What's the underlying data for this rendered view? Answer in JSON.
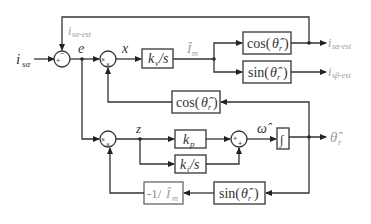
{
  "diagram": {
    "type": "block-diagram",
    "title": "",
    "inputs": {
      "i_s_alpha": {
        "base": "i",
        "sub": "sα"
      }
    },
    "feedback_label": {
      "base": "i",
      "sub": "sα-est"
    },
    "signals": {
      "e": "e",
      "x": "x",
      "z": "z",
      "Im_hat": {
        "base": "Î",
        "sub": "m"
      },
      "omega_hat": "ω̂"
    },
    "blocks": {
      "kv_s": {
        "k": "k",
        "sub": "v",
        "rest": "/s"
      },
      "cos_top": {
        "fn": "cos(",
        "theta": "θ̂",
        "sub": "r",
        "close": ")"
      },
      "sin_top": {
        "fn": "sin(",
        "theta": "θ̂",
        "sub": "r",
        "close": ")"
      },
      "cos_mid": {
        "fn": "cos(",
        "theta": "θ̂",
        "sub": "r",
        "close": ")"
      },
      "kp": {
        "k": "k",
        "sub": "p"
      },
      "ki_s": {
        "k": "k",
        "sub": "i",
        "rest": "/s"
      },
      "integrator": {
        "symbol": "∫"
      },
      "neg_inv_Im": {
        "prefix": "-1/ ",
        "base": "Î",
        "sub": "m"
      },
      "sin_bottom": {
        "fn": "sin(",
        "theta": "θ̂",
        "sub": "r",
        "close": ")"
      }
    },
    "junctions": {
      "sum1": {
        "signs": [
          "+",
          "−"
        ]
      },
      "mult1": {
        "signs": [
          "×",
          "×"
        ]
      },
      "mult2": {
        "signs": [
          "×",
          "×"
        ]
      },
      "sum2": {
        "signs": [
          "+",
          "+"
        ]
      }
    },
    "outputs": {
      "i_s_alpha_est": {
        "base": "i",
        "sub": "sα-est"
      },
      "i_s_beta_est": {
        "base": "i",
        "sub": "sβ-est"
      },
      "theta_r_hat": {
        "theta": "θ̂",
        "sub": "r"
      }
    },
    "colors": {
      "line": "#333333",
      "text": "#333333",
      "gray_text": "#9a9a9a"
    }
  }
}
